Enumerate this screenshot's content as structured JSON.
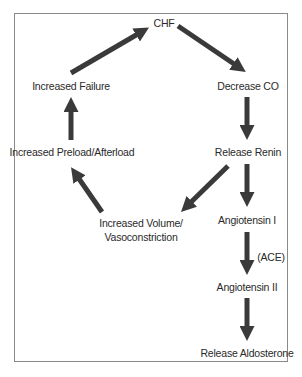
{
  "diagram": {
    "type": "flowchart",
    "nodes": {
      "chf": "CHF",
      "decrease_co": "Decrease CO",
      "release_renin": "Release Renin",
      "angiotensin_1": "Angiotensin I",
      "angiotensin_2": "Angiotensin II",
      "release_aldosterone": "Release Aldosterone",
      "increased_volume_line1": "Increased Volume/",
      "increased_volume_line2": "Vasoconstriction",
      "increased_preload": "Increased Preload/Afterload",
      "increased_failure": "Increased Failure"
    },
    "edge_labels": {
      "ace": "(ACE)"
    },
    "edges": [
      {
        "from": "CHF",
        "to": "Decrease CO"
      },
      {
        "from": "Decrease CO",
        "to": "Release Renin"
      },
      {
        "from": "Release Renin",
        "to": "Angiotensin I"
      },
      {
        "from": "Angiotensin I",
        "to": "Angiotensin II",
        "label": "(ACE)"
      },
      {
        "from": "Angiotensin II",
        "to": "Release Aldosterone"
      },
      {
        "from": "Release Renin",
        "to": "Increased Volume/Vasoconstriction"
      },
      {
        "from": "Increased Volume/Vasoconstriction",
        "to": "Increased Preload/Afterload"
      },
      {
        "from": "Increased Preload/Afterload",
        "to": "Increased Failure"
      },
      {
        "from": "Increased Failure",
        "to": "CHF"
      }
    ],
    "colors": {
      "arrow": "#3a3a3a",
      "border": "#8a8a8a",
      "text": "#2a2a2a"
    }
  }
}
